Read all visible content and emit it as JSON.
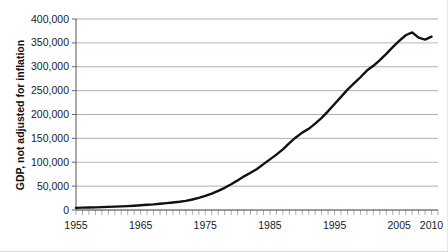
{
  "chart_data": {
    "type": "line",
    "title": "",
    "xlabel": "",
    "ylabel": "GDP, not adjusted for inflation",
    "xlim": [
      1955,
      2011
    ],
    "ylim": [
      0,
      400000
    ],
    "grid": true,
    "legend": "none",
    "y_ticks": [
      "0",
      "50,000",
      "100,000",
      "150,000",
      "200,000",
      "250,000",
      "300,000",
      "350,000",
      "400,000"
    ],
    "y_tick_values": [
      0,
      50000,
      100000,
      150000,
      200000,
      250000,
      300000,
      350000,
      400000
    ],
    "x_ticks": [
      "1955",
      "1965",
      "1975",
      "1985",
      "1995",
      "2005",
      "2010"
    ],
    "x_tick_values": [
      1955,
      1965,
      1975,
      1985,
      1995,
      2005,
      2010
    ],
    "x_minor_tick_step": 1,
    "series": [
      {
        "name": "GDP",
        "color": "#111111",
        "x": [
          1955,
          1956,
          1957,
          1958,
          1959,
          1960,
          1961,
          1962,
          1963,
          1964,
          1965,
          1966,
          1967,
          1968,
          1969,
          1970,
          1971,
          1972,
          1973,
          1974,
          1975,
          1976,
          1977,
          1978,
          1979,
          1980,
          1981,
          1982,
          1983,
          1984,
          1985,
          1986,
          1987,
          1988,
          1989,
          1990,
          1991,
          1992,
          1993,
          1994,
          1995,
          1996,
          1997,
          1998,
          1999,
          2000,
          2001,
          2002,
          2003,
          2004,
          2005,
          2006,
          2007,
          2008,
          2009,
          2010
        ],
        "values": [
          4500,
          4900,
          5300,
          5600,
          6100,
          6500,
          7000,
          7600,
          8200,
          8900,
          9800,
          10900,
          11800,
          13000,
          14300,
          15600,
          17200,
          19200,
          22000,
          25500,
          29500,
          34500,
          40000,
          46500,
          54000,
          62000,
          70500,
          78000,
          86000,
          96000,
          106000,
          116000,
          127000,
          140000,
          152000,
          162000,
          170000,
          181000,
          193000,
          207000,
          222000,
          237000,
          252000,
          265000,
          278000,
          292000,
          302000,
          314000,
          327000,
          341000,
          354000,
          366000,
          372000,
          361000,
          357000,
          363000
        ]
      }
    ]
  }
}
